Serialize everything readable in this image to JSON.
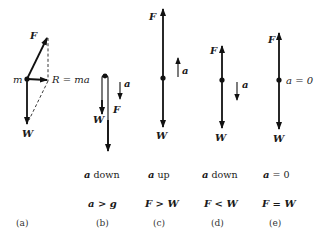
{
  "diagram": {
    "panels": [
      {
        "id": "a",
        "caption": "(a)",
        "labels": {
          "force": "F",
          "mass": "m",
          "resultant": "R = ma",
          "weight": "W"
        }
      },
      {
        "id": "b",
        "caption": "(b)",
        "labels": {
          "force": "F",
          "weight": "W",
          "accel": "a"
        },
        "condition_1_sym": "a",
        "condition_1_text": " down",
        "condition_2": "a > g"
      },
      {
        "id": "c",
        "caption": "(c)",
        "labels": {
          "force": "F",
          "weight": "W",
          "accel": "a"
        },
        "condition_1_sym": "a",
        "condition_1_text": " up",
        "condition_2": "F > W"
      },
      {
        "id": "d",
        "caption": "(d)",
        "labels": {
          "force": "F",
          "weight": "W",
          "accel": "a"
        },
        "condition_1_sym": "a",
        "condition_1_text": " down",
        "condition_2": "F < W"
      },
      {
        "id": "e",
        "caption": "(e)",
        "labels": {
          "force": "F",
          "weight": "W",
          "accel": "a = 0"
        },
        "condition_1_sym": "a",
        "condition_1_text": " = 0",
        "condition_2": "F = W"
      }
    ]
  },
  "colors": {
    "ink": "#111111",
    "background": "#ffffff"
  }
}
